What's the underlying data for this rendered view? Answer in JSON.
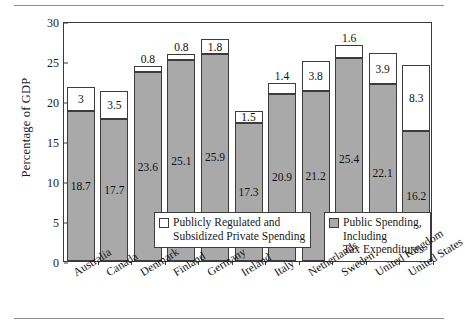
{
  "chart_data": {
    "type": "bar",
    "subtype": "stacked-bar",
    "title": "",
    "xlabel": "",
    "ylabel": "Percentage of GDP",
    "ylim": [
      0,
      30
    ],
    "yticks": [
      0,
      5,
      10,
      15,
      20,
      25,
      30
    ],
    "grid": false,
    "legend_position": "inside-bottom",
    "categories": [
      "Australia",
      "Canada",
      "Denmark",
      "Finland",
      "Germany",
      "Ireland",
      "Italy",
      "Netherlands",
      "Sweden",
      "United Kingdom",
      "United States"
    ],
    "series": [
      {
        "name": "Public Spending, Including Tax Expenditures",
        "color": "#a9a9a9",
        "values": [
          18.7,
          17.7,
          23.6,
          25.1,
          25.9,
          17.3,
          20.9,
          21.2,
          25.4,
          22.1,
          16.2
        ]
      },
      {
        "name": "Publicly Regulated and Subsidized Private Spending",
        "color": "#ffffff",
        "values": [
          3,
          3.5,
          0.8,
          0.8,
          1.8,
          1.5,
          1.4,
          3.8,
          1.6,
          3.9,
          8.3
        ]
      }
    ],
    "value_labels": {
      "lower": [
        "18.7",
        "17.7",
        "23.6",
        "25.1",
        "25.9",
        "17.3",
        "20.9",
        "21.2",
        "25.4",
        "22.1",
        "16.2"
      ],
      "upper": [
        "3",
        "3.5",
        "0.8",
        "0.8",
        "1.8",
        "1.5",
        "1.4",
        "3.8",
        "1.6",
        "3.9",
        "8.3"
      ],
      "upper_placement": [
        "inside",
        "inside",
        "above",
        "above",
        "inside",
        "inside",
        "above",
        "inside",
        "above",
        "inside",
        "inside"
      ]
    }
  },
  "legend": {
    "private": {
      "label": "Publicly Regulated and\nSubsidized Private Spending",
      "swatch": "white-square-swatch"
    },
    "public": {
      "label": "Public Spending, Including\nTax Expenditures",
      "swatch": "gray-square-swatch"
    }
  },
  "axis": {
    "y_title": "Percentage of GDP",
    "y_tick_labels": [
      "0",
      "5",
      "10",
      "15",
      "20",
      "25",
      "30"
    ]
  },
  "colors": {
    "public_spending": "#a9a9a9",
    "private_spending": "#ffffff",
    "frame": "#3a3a3a",
    "rule": "#8d8d8d"
  }
}
